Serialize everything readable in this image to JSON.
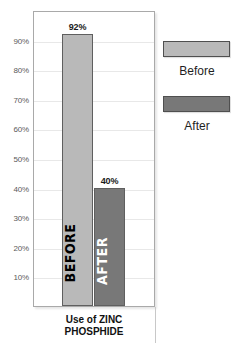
{
  "chart_data": {
    "type": "bar",
    "title": "Use of ZINC PHOSPHIDE",
    "xlabel": "",
    "ylabel": "",
    "ylim": [
      0,
      100
    ],
    "grid": true,
    "legend_position": "right",
    "categories": [
      "Before",
      "After"
    ],
    "values": [
      92,
      40
    ],
    "value_labels": [
      "92%",
      "40%"
    ],
    "bar_inner_labels": [
      "BEFORE",
      "AFTER"
    ],
    "colors": {
      "before": "#b9b9b9",
      "after": "#787878",
      "bar_border": "#5f5f5f",
      "frame_border": "#a9a9a9",
      "gridline": "#e8e8e8",
      "tick_text": "#5a5a5a",
      "caption_text": "#111111"
    },
    "y_ticks": [
      {
        "value": 90,
        "label": "90%"
      },
      {
        "value": 80,
        "label": "80%"
      },
      {
        "value": 70,
        "label": "70%"
      },
      {
        "value": 60,
        "label": "60%"
      },
      {
        "value": 50,
        "label": "50%"
      },
      {
        "value": 40,
        "label": "40%"
      },
      {
        "value": 30,
        "label": "30%"
      },
      {
        "value": 20,
        "label": "20%"
      },
      {
        "value": 10,
        "label": "10%"
      }
    ],
    "legend": [
      {
        "label": "Before",
        "color": "#b9b9b9"
      },
      {
        "label": "After",
        "color": "#787878"
      }
    ],
    "caption_lines": [
      "Use of ZINC",
      "PHOSPHIDE"
    ]
  }
}
